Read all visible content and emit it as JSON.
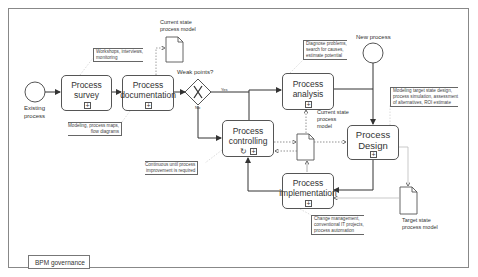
{
  "diagram": {
    "title": "BPM governance",
    "start_event": {
      "label": "Existing\nprocess"
    },
    "new_process_event": {
      "label": "New process"
    },
    "gateway": {
      "label": "Weak points?",
      "yes_label": "Yes",
      "no_label": "No"
    },
    "tasks": {
      "survey": {
        "label": "Process survey"
      },
      "documentation": {
        "label": "Process\ndocumentation"
      },
      "analysis": {
        "label": "Process\nanalysis"
      },
      "controlling": {
        "label": "Process\ncontrolling"
      },
      "design": {
        "label": "Process\nDesign"
      },
      "implementation": {
        "label": "Process\nimplementation"
      }
    },
    "documents": {
      "current_state_top": {
        "label": "Current state\nprocess model"
      },
      "current_state_center": {
        "label": "Current state\nprocess\nmodel"
      },
      "target_state": {
        "label": "Target state\nprocess model"
      }
    },
    "annotations": {
      "survey": "Workshops, interviews,\nmonitoring",
      "documentation": "Modeling, process maps,\nflow diagrams",
      "controlling": "Continuous until process\nimprovement is required",
      "analysis": "Diagnose problems,\nsearch for causes,\nestimate potential",
      "design": "Modeling target state design,\nprocess simulation, assessment\nof alternatives, ROI estimate",
      "implementation": "Change management,\nconventional IT projects,\nprocess automation"
    },
    "subprocess_marker": "+",
    "loop_marker": "↻",
    "colors": {
      "stroke": "#555555",
      "text": "#333333",
      "background": "#ffffff",
      "annotation_connector": "#cccccc"
    }
  }
}
